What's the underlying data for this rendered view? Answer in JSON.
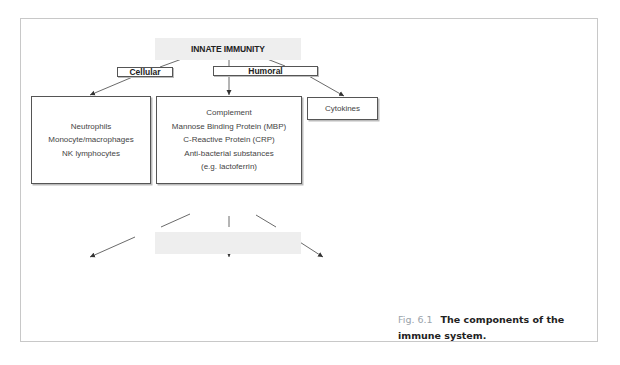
{
  "innate": {
    "title": "INNATE IMMUNITY",
    "cellular_label": "Cellular",
    "humoral_label": "Humoral",
    "cellular_items": [
      "Neutrophils",
      "Monocyte/macrophages",
      "NK lymphocytes"
    ],
    "humoral_items": [
      "Complement",
      "Mannose Binding Protein (MBP)",
      "C-Reactive Protein (CRP)",
      "Anti-bacterial substances",
      "(e.g. lactoferrin)"
    ],
    "cytokines_label": "Cytokines"
  },
  "adaptive": {
    "title": "ADAPTIVE IMMUNITY",
    "cellular_label": "Cellular",
    "humoral_label": "Humoral",
    "t_lymphocytes_label": "T lymphocytes",
    "t_subsets": [
      "CD4+ = 'Helper'",
      "CD8+ = 'Cytotoxic'"
    ],
    "paren_open": "(",
    "paren_close": ")",
    "b_lymphocytes_label": "B lymphocytes",
    "antibodies_label": "Antibodies",
    "cytokines_label": "Cytokines"
  },
  "caption": {
    "fig_number": "Fig. 6.1",
    "title_line": "The components of the immune system."
  },
  "colors": {
    "band": "#eeeeee",
    "border": "#555555",
    "frame": "#c8c8c8",
    "fig_label": "#9aa3ab"
  }
}
